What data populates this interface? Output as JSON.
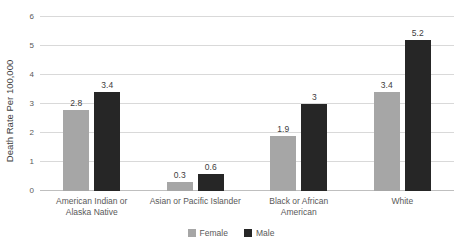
{
  "chart_data": {
    "type": "bar",
    "title": "",
    "categories": [
      "American Indian or Alaska Native",
      "Asian or Pacific Islander",
      "Black or African American",
      "White"
    ],
    "series": [
      {
        "name": "Female",
        "color": "#a6a6a6",
        "values": [
          2.8,
          0.3,
          1.9,
          3.4
        ]
      },
      {
        "name": "Male",
        "color": "#262626",
        "values": [
          3.4,
          0.6,
          3,
          5.2
        ]
      }
    ],
    "ylabel": "Death Rate Per 100,000",
    "ylim": [
      0,
      6
    ],
    "yticks": [
      0,
      1,
      2,
      3,
      4,
      5,
      6
    ],
    "grid": true,
    "legend_position": "bottom",
    "gridline_color": "#d9d9d9",
    "axis_text_color": "#595959",
    "label_text_color": "#404040"
  }
}
